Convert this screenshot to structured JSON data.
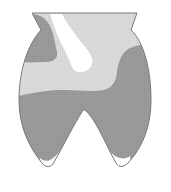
{
  "diagram": {
    "type": "shaded-outline",
    "regions": [
      {
        "name": "light-region",
        "shade": "light-gray",
        "color": "#d8d8d8"
      },
      {
        "name": "dark-region",
        "shade": "dark-gray",
        "color": "#9a9a9a"
      },
      {
        "name": "white-region",
        "shade": "white",
        "color": "#ffffff"
      }
    ],
    "outline_color": "#7a7a7a",
    "labels": []
  }
}
